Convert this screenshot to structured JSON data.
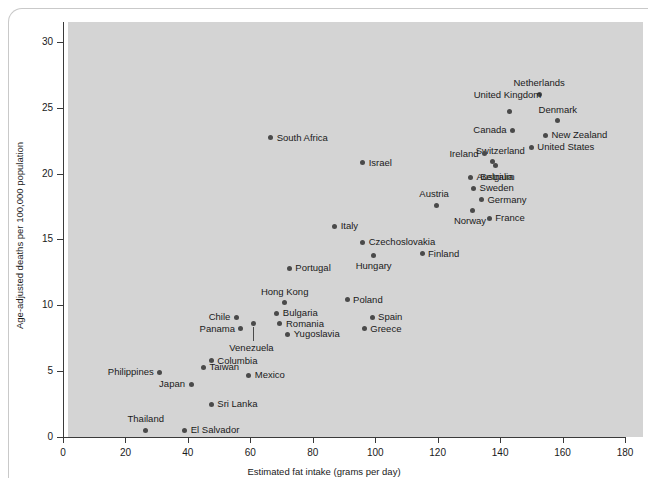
{
  "chart_data": {
    "type": "scatter",
    "title": "",
    "xlabel": "Estimated fat intake (grams per day)",
    "ylabel": "Age-adjusted deaths per 100,000 population",
    "xlim": [
      0,
      180
    ],
    "ylim": [
      0,
      31.5
    ],
    "xticks": [
      0,
      20,
      40,
      60,
      80,
      100,
      120,
      140,
      160,
      180
    ],
    "yticks": [
      0,
      5,
      10,
      15,
      20,
      25,
      30
    ],
    "grid": false,
    "legend": "none",
    "point_color": "#4a4a4a",
    "panel_color": "#d4d4d4",
    "points": [
      {
        "label": "Netherlands",
        "x": 152.5,
        "y": 26.0,
        "label_pos": "c",
        "label_dx": 0,
        "label_dy": -11
      },
      {
        "label": "Denmark",
        "x": 158.5,
        "y": 24.0,
        "label_pos": "c",
        "label_dx": 0,
        "label_dy": -11
      },
      {
        "label": "United States",
        "x": 150.0,
        "y": 22.0,
        "label_pos": "r",
        "label_dx": 6,
        "label_dy": 0
      },
      {
        "label": "New Zealand",
        "x": 154.5,
        "y": 22.9,
        "label_pos": "r",
        "label_dx": 6,
        "label_dy": 0
      },
      {
        "label": "United Kingdom",
        "x": 143.0,
        "y": 24.7,
        "label_pos": "c",
        "label_dx": -2,
        "label_dy": -17
      },
      {
        "label": "Canada",
        "x": 144.0,
        "y": 23.3,
        "label_pos": "l",
        "label_dx": -6,
        "label_dy": 0
      },
      {
        "label": "Switzerland",
        "x": 137.5,
        "y": 20.9,
        "label_pos": "c",
        "label_dx": 8,
        "label_dy": -11
      },
      {
        "label": "Ireland",
        "x": 135.0,
        "y": 21.5,
        "label_pos": "l",
        "label_dx": -6,
        "label_dy": 0
      },
      {
        "label": "Belgium",
        "x": 138.5,
        "y": 20.6,
        "label_pos": "c",
        "label_dx": 2,
        "label_dy": 11
      },
      {
        "label": "Australia",
        "x": 130.5,
        "y": 19.7,
        "label_pos": "r",
        "label_dx": 6,
        "label_dy": 0
      },
      {
        "label": "Sweden",
        "x": 131.5,
        "y": 18.9,
        "label_pos": "r",
        "label_dx": 6,
        "label_dy": 0
      },
      {
        "label": "Germany",
        "x": 134.0,
        "y": 18.0,
        "label_pos": "r",
        "label_dx": 6,
        "label_dy": 0
      },
      {
        "label": "Norway",
        "x": 131.0,
        "y": 17.2,
        "label_pos": "c",
        "label_dx": -2,
        "label_dy": 11
      },
      {
        "label": "France",
        "x": 136.5,
        "y": 16.6,
        "label_pos": "r",
        "label_dx": 6,
        "label_dy": 0
      },
      {
        "label": "Austria",
        "x": 119.5,
        "y": 17.6,
        "label_pos": "c",
        "label_dx": -2,
        "label_dy": -11
      },
      {
        "label": "Finland",
        "x": 115.0,
        "y": 13.9,
        "label_pos": "r",
        "label_dx": 6,
        "label_dy": 0
      },
      {
        "label": "South Africa",
        "x": 66.5,
        "y": 22.7,
        "label_pos": "r",
        "label_dx": 6,
        "label_dy": 0
      },
      {
        "label": "Israel",
        "x": 96.0,
        "y": 20.8,
        "label_pos": "r",
        "label_dx": 6,
        "label_dy": 0
      },
      {
        "label": "Italy",
        "x": 87.0,
        "y": 16.0,
        "label_pos": "r",
        "label_dx": 6,
        "label_dy": 0
      },
      {
        "label": "Czechoslovakia",
        "x": 96.0,
        "y": 14.8,
        "label_pos": "r",
        "label_dx": 6,
        "label_dy": 0
      },
      {
        "label": "Hungary",
        "x": 99.5,
        "y": 13.8,
        "label_pos": "c",
        "label_dx": 0,
        "label_dy": 11
      },
      {
        "label": "Portugal",
        "x": 72.5,
        "y": 12.8,
        "label_pos": "r",
        "label_dx": 6,
        "label_dy": 0
      },
      {
        "label": "Hong Kong",
        "x": 71.0,
        "y": 10.2,
        "label_pos": "c",
        "label_dx": 0,
        "label_dy": -11
      },
      {
        "label": "Poland",
        "x": 91.0,
        "y": 10.4,
        "label_pos": "r",
        "label_dx": 6,
        "label_dy": 0
      },
      {
        "label": "Bulgaria",
        "x": 68.5,
        "y": 9.4,
        "label_pos": "r",
        "label_dx": 6,
        "label_dy": 0
      },
      {
        "label": "Romania",
        "x": 69.5,
        "y": 8.6,
        "label_pos": "r",
        "label_dx": 6,
        "label_dy": 0
      },
      {
        "label": "Yugoslavia",
        "x": 72.0,
        "y": 7.8,
        "label_pos": "r",
        "label_dx": 6,
        "label_dy": 0
      },
      {
        "label": "Chile",
        "x": 55.5,
        "y": 9.1,
        "label_pos": "l",
        "label_dx": -6,
        "label_dy": 0
      },
      {
        "label": "Panama",
        "x": 57.0,
        "y": 8.2,
        "label_pos": "l",
        "label_dx": -6,
        "label_dy": 0
      },
      {
        "label": "Venezuela",
        "x": 61.0,
        "y": 8.6,
        "label_pos": "c",
        "label_dx": -2,
        "label_dy": 24,
        "leader": 14
      },
      {
        "label": "Spain",
        "x": 99.0,
        "y": 9.1,
        "label_pos": "r",
        "label_dx": 6,
        "label_dy": 0
      },
      {
        "label": "Greece",
        "x": 96.5,
        "y": 8.2,
        "label_pos": "r",
        "label_dx": 6,
        "label_dy": 0
      },
      {
        "label": "Columbia",
        "x": 47.5,
        "y": 5.8,
        "label_pos": "r",
        "label_dx": 6,
        "label_dy": 0
      },
      {
        "label": "Philippines",
        "x": 31.0,
        "y": 4.9,
        "label_pos": "l",
        "label_dx": -6,
        "label_dy": 0
      },
      {
        "label": "Taiwan",
        "x": 45.0,
        "y": 5.3,
        "label_pos": "r",
        "label_dx": 6,
        "label_dy": 0
      },
      {
        "label": "Japan",
        "x": 41.0,
        "y": 4.0,
        "label_pos": "l",
        "label_dx": -6,
        "label_dy": 0
      },
      {
        "label": "Mexico",
        "x": 59.5,
        "y": 4.7,
        "label_pos": "r",
        "label_dx": 6,
        "label_dy": 0
      },
      {
        "label": "Sri Lanka",
        "x": 47.5,
        "y": 2.5,
        "label_pos": "r",
        "label_dx": 6,
        "label_dy": 0
      },
      {
        "label": "Thailand",
        "x": 26.5,
        "y": 0.5,
        "label_pos": "c",
        "label_dx": 0,
        "label_dy": -11
      },
      {
        "label": "El Salvador",
        "x": 39.0,
        "y": 0.5,
        "label_pos": "r",
        "label_dx": 6,
        "label_dy": 0
      }
    ]
  }
}
